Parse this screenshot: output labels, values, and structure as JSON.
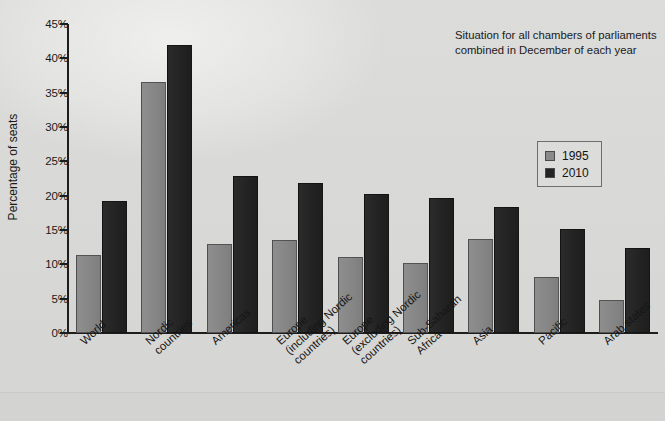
{
  "chart_data": {
    "type": "bar",
    "title": "",
    "subtitle": "",
    "annotation": {
      "line1": "Situation for all chambers of parliaments",
      "line2": "combined in December of each year"
    },
    "xlabel": "",
    "ylabel": "Percentage of seats",
    "ylim": [
      0,
      45
    ],
    "ytick_labels": [
      "0%",
      "5%",
      "10%",
      "15%",
      "20%",
      "25%",
      "30%",
      "35%",
      "40%",
      "45%"
    ],
    "ytick_values": [
      0,
      5,
      10,
      15,
      20,
      25,
      30,
      35,
      40,
      45
    ],
    "grid": false,
    "legend_position": "right",
    "categories": [
      "World",
      "Nordic countries",
      "Americas",
      "Europe (including Nordic countries)",
      "Europe (excluding Nordic countries)",
      "Sub-Saharan Africa",
      "Asia",
      "Pacific",
      "Arab states"
    ],
    "category_lines": [
      [
        "World",
        ""
      ],
      [
        "Nordic",
        "countries"
      ],
      [
        "Americas",
        ""
      ],
      [
        "Europe",
        "(including Nordic",
        "countries)"
      ],
      [
        "Europe",
        "(excluding Nordic",
        "countries)"
      ],
      [
        "Sub-Saharan",
        "Africa"
      ],
      [
        "Asia",
        ""
      ],
      [
        "Pacific",
        ""
      ],
      [
        "Arab states",
        ""
      ]
    ],
    "series": [
      {
        "name": "1995",
        "color": "#8a8a8a",
        "values": [
          11.4,
          36.5,
          12.9,
          13.5,
          11.0,
          10.2,
          13.7,
          8.2,
          4.8
        ]
      },
      {
        "name": "2010",
        "color": "#242424",
        "values": [
          19.2,
          41.9,
          22.8,
          21.8,
          20.3,
          19.6,
          18.4,
          15.2,
          12.4
        ]
      }
    ]
  },
  "legend": {
    "items": [
      {
        "label": "1995",
        "color": "#8a8a8a"
      },
      {
        "label": "2010",
        "color": "#242424"
      }
    ]
  }
}
